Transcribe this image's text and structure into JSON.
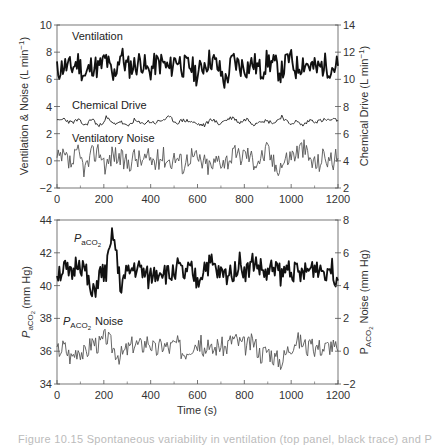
{
  "chart_data": [
    {
      "type": "line",
      "panel": "top",
      "title": "",
      "xlabel": "",
      "ylabel": "Ventilation & Noise (L min⁻¹)",
      "ylabel_right": "Chemical Drive (L min⁻¹)",
      "xlim": [
        0,
        1200
      ],
      "ylim": [
        -2,
        10
      ],
      "ylim_right": [
        2,
        14
      ],
      "xticks": [
        "0",
        "200",
        "400",
        "600",
        "800",
        "1000",
        "1200"
      ],
      "yticks": [
        "-2",
        "0",
        "2",
        "4",
        "6",
        "8",
        "10"
      ],
      "yticks_right": [
        "2",
        "4",
        "6",
        "8",
        "10",
        "12",
        "14"
      ],
      "grid": false,
      "x": [
        0,
        30,
        60,
        90,
        120,
        150,
        180,
        210,
        240,
        270,
        300,
        330,
        360,
        390,
        420,
        450,
        480,
        510,
        540,
        570,
        600,
        630,
        660,
        690,
        720,
        750,
        780,
        810,
        840,
        870,
        900,
        930,
        960,
        990,
        1020,
        1050,
        1080,
        1110,
        1140,
        1170,
        1200
      ],
      "series": [
        {
          "name": "Ventilation",
          "axis": "left",
          "stroke": "#111111",
          "width": 1.8,
          "noise": 0.9,
          "seed": 11,
          "values": [
            6.6,
            7.0,
            6.8,
            7.3,
            6.2,
            7.1,
            6.8,
            7.5,
            6.0,
            7.9,
            6.9,
            7.0,
            7.4,
            6.5,
            7.1,
            7.2,
            6.7,
            7.6,
            6.9,
            7.0,
            6.3,
            7.2,
            7.5,
            6.8,
            5.8,
            7.4,
            7.0,
            6.9,
            7.2,
            6.6,
            7.4,
            7.0,
            6.5,
            7.6,
            6.8,
            7.3,
            7.0,
            6.7,
            7.1,
            6.9,
            7.0
          ]
        },
        {
          "name": "Chemical Drive",
          "axis": "left",
          "stroke": "#333333",
          "width": 1.0,
          "noise": 0.15,
          "seed": 23,
          "values": [
            2.9,
            3.1,
            2.8,
            3.0,
            2.6,
            3.1,
            2.5,
            3.2,
            2.7,
            2.9,
            2.5,
            3.0,
            2.7,
            2.9,
            2.8,
            3.0,
            3.2,
            2.8,
            3.0,
            2.9,
            2.7,
            2.6,
            3.1,
            2.7,
            3.0,
            3.2,
            2.8,
            3.1,
            2.7,
            3.0,
            2.9,
            2.8,
            3.3,
            2.7,
            2.9,
            2.6,
            3.0,
            2.9,
            3.0,
            3.0,
            3.0
          ]
        },
        {
          "name": "Ventilatory Noise",
          "axis": "left",
          "stroke": "#555555",
          "width": 0.9,
          "noise": 0.8,
          "seed": 37,
          "values": [
            0.0,
            0.2,
            -0.3,
            0.5,
            -0.6,
            0.4,
            0.8,
            -0.4,
            0.6,
            0.1,
            -0.2,
            0.3,
            0.0,
            0.2,
            -0.1,
            0.4,
            0.0,
            0.3,
            -0.3,
            0.5,
            0.1,
            -0.2,
            -0.5,
            0.2,
            0.0,
            0.4,
            0.3,
            0.6,
            0.0,
            0.2,
            0.8,
            -0.4,
            -0.2,
            0.3,
            0.6,
            1.0,
            0.1,
            -0.3,
            0.4,
            0.0,
            0.2
          ]
        }
      ],
      "annotations": [
        {
          "text": "Ventilation",
          "x": 80,
          "y": 9.3
        },
        {
          "text": "Chemical Drive",
          "x": 80,
          "y": 4.1
        },
        {
          "text": "Ventilatory Noise",
          "x": 80,
          "y": 1.6
        }
      ]
    },
    {
      "type": "line",
      "panel": "bottom",
      "title": "",
      "xlabel": "Time (s)",
      "ylabel": "PaCO2 (mm Hg)",
      "ylabel_right": "PACO2 Noise (mm Hg)",
      "xlim": [
        0,
        1200
      ],
      "ylim": [
        34,
        44
      ],
      "ylim_right": [
        -2,
        8
      ],
      "xticks": [
        "0",
        "200",
        "400",
        "600",
        "800",
        "1000",
        "1200"
      ],
      "yticks": [
        "34",
        "36",
        "38",
        "40",
        "42",
        "44"
      ],
      "yticks_right": [
        "-2",
        "0",
        "2",
        "4",
        "6",
        "8"
      ],
      "grid": false,
      "x": [
        0,
        30,
        60,
        90,
        120,
        150,
        180,
        210,
        240,
        270,
        300,
        330,
        360,
        390,
        420,
        450,
        480,
        510,
        540,
        570,
        600,
        630,
        660,
        690,
        720,
        750,
        780,
        810,
        840,
        870,
        900,
        930,
        960,
        990,
        1020,
        1050,
        1080,
        1110,
        1140,
        1170,
        1200
      ],
      "series": [
        {
          "name": "PaCO2",
          "axis": "left",
          "stroke": "#111111",
          "width": 1.8,
          "noise": 0.7,
          "seed": 51,
          "values": [
            40.8,
            41.0,
            40.5,
            41.6,
            40.9,
            39.2,
            40.6,
            40.8,
            43.2,
            40.0,
            40.7,
            41.1,
            40.9,
            40.4,
            40.8,
            41.0,
            40.5,
            41.2,
            40.6,
            40.9,
            40.2,
            41.2,
            41.3,
            40.7,
            40.6,
            40.9,
            41.4,
            40.8,
            41.5,
            41.0,
            40.6,
            41.3,
            40.5,
            41.2,
            40.8,
            40.6,
            41.0,
            41.2,
            40.9,
            41.1,
            40.3
          ]
        },
        {
          "name": "PACO2 Noise",
          "axis": "right",
          "stroke": "#555555",
          "width": 0.9,
          "noise": 0.6,
          "seed": 67,
          "values": [
            0.0,
            0.3,
            -0.4,
            0.2,
            -0.2,
            0.6,
            0.4,
            0.9,
            0.2,
            -0.3,
            0.1,
            0.5,
            0.3,
            0.7,
            0.0,
            0.4,
            0.2,
            0.5,
            -0.1,
            0.3,
            0.6,
            0.2,
            0.0,
            0.4,
            0.2,
            0.8,
            0.5,
            0.3,
            0.6,
            -0.2,
            0.1,
            -0.4,
            -0.6,
            0.2,
            0.7,
            0.5,
            0.1,
            0.3,
            0.2,
            0.4,
            0.0
          ]
        }
      ],
      "annotations": [
        {
          "text": "PaCO2",
          "x": 80,
          "y": 42.6
        },
        {
          "text": "PACO2 Noise",
          "x": 60,
          "y": 37.8
        }
      ]
    }
  ],
  "labels": {
    "top_left_axis": "Ventilation & Noise (L min",
    "top_right_axis": "Chemical Drive (L min",
    "unit_sup": "−1",
    "unit_close": ")",
    "ventilation": "Ventilation",
    "chemical_drive": "Chemical Drive",
    "ventilatory_noise": "Ventilatory Noise",
    "p": "P",
    "sub_a": "aCO",
    "sub_A": "ACO",
    "two": "2",
    "noise_word": "Noise",
    "bottom_left_axis_suffix": "(mm Hg)",
    "bottom_right_axis_suffix": "Noise (mm Hg)",
    "x_axis": "Time (s)"
  },
  "caption": "Figure 10.15   Spontaneous variability in ventilation (top panel, black trace) and P"
}
